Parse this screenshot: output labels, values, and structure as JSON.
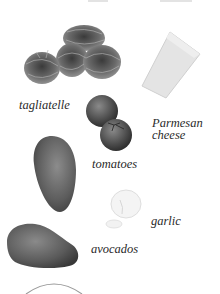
{
  "page": {
    "background": "#ffffff",
    "ingredients": [
      {
        "name": "tagliatelle",
        "label": "tagliatelle"
      },
      {
        "name": "parmesan",
        "label_line1": "Parmesan",
        "label_line2": "cheese"
      },
      {
        "name": "tomatoes",
        "label": "tomatoes"
      },
      {
        "name": "garlic",
        "label": "garlic"
      },
      {
        "name": "avocados",
        "label": "avocados"
      }
    ]
  }
}
